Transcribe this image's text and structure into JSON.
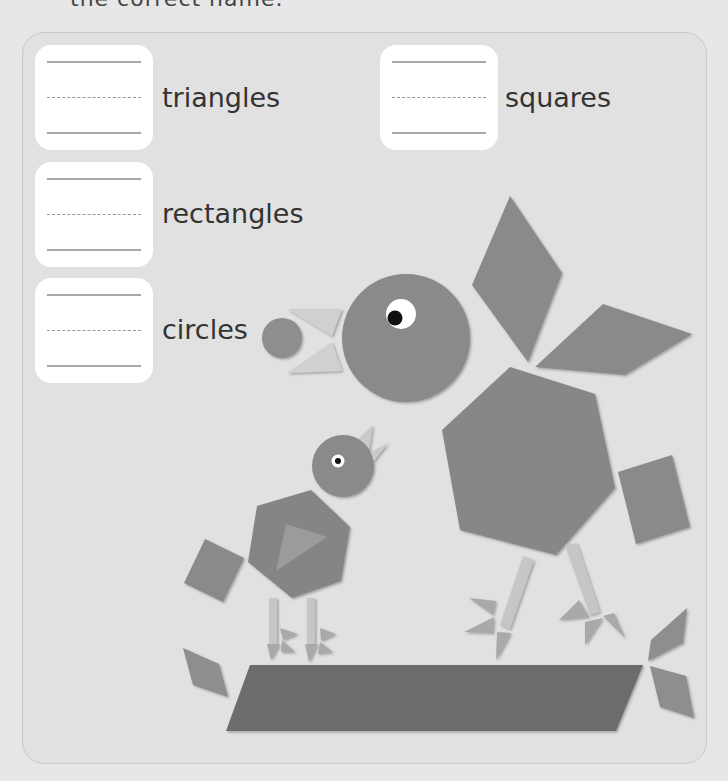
{
  "instruction": {
    "text": "the correct name."
  },
  "answer_boxes": [
    {
      "id": "triangles",
      "label": "triangles",
      "value": ""
    },
    {
      "id": "squares",
      "label": "squares",
      "value": ""
    },
    {
      "id": "rectangles",
      "label": "rectangles",
      "value": ""
    },
    {
      "id": "circles",
      "label": "circles",
      "value": ""
    }
  ],
  "colors": {
    "background": "#e7e7e7",
    "panel": "#e1e1e1",
    "shape": "#8a8a8a",
    "shape_light": "#c9c9c9",
    "parallelogram": "#6e6e6e",
    "box": "#ffffff"
  },
  "scene": {
    "description": "Two birds built from pattern-block shapes standing on a parallelogram",
    "shapes": [
      "circle",
      "hexagon",
      "rhombus",
      "square",
      "triangle",
      "rectangle",
      "parallelogram"
    ]
  }
}
